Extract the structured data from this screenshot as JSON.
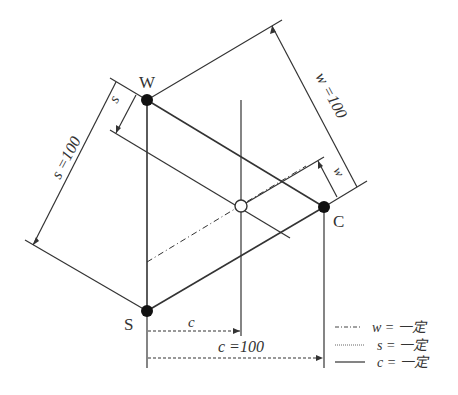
{
  "diagram": {
    "type": "ternary-phase-diagram",
    "vertices": {
      "W": {
        "label": "W",
        "x": 147,
        "y": 100
      },
      "S": {
        "label": "S",
        "x": 147,
        "y": 311
      },
      "C": {
        "label": "C",
        "x": 324,
        "y": 207
      }
    },
    "point": {
      "name": "composition-point",
      "x": 241,
      "y": 206
    },
    "dimensions": {
      "s_full": "s =100",
      "s_partial": "s",
      "w_full": "w =100",
      "w_partial": "w",
      "c_full": "c =100",
      "c_partial": "c"
    },
    "legend": [
      {
        "style": "dash-dot",
        "label": "w = 一定"
      },
      {
        "style": "dotted",
        "label": "s = 一定"
      },
      {
        "style": "solid",
        "label": "c = 一定"
      }
    ]
  }
}
